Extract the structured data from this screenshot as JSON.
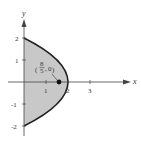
{
  "figure": {
    "axes": {
      "x_label": "x",
      "y_label": "y",
      "x_ticks": [
        "1",
        "2",
        "3"
      ],
      "y_ticks": [
        "2",
        "1",
        "-1",
        "-2"
      ]
    },
    "region": {
      "curve": "x = 4 - y^2",
      "fill_color": "#c8c8c8",
      "boundary_color": "#222222"
    },
    "point": {
      "label_num": "8",
      "label_den": "5",
      "label_y": "0",
      "x": 1.6,
      "y": 0
    }
  }
}
